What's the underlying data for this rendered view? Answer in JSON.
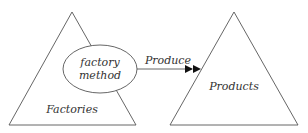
{
  "diagram": {
    "type": "factory-method-pattern",
    "nodes": {
      "factories": {
        "label": "Factories",
        "shape": "triangle"
      },
      "factory_method": {
        "label_line1": "factory",
        "label_line2": "method",
        "shape": "ellipse"
      },
      "products": {
        "label": "Products",
        "shape": "triangle"
      }
    },
    "edges": [
      {
        "from": "factory_method",
        "to": "products",
        "label": "Produce",
        "arrowhead": "double-filled"
      }
    ],
    "colors": {
      "stroke": "#555555",
      "text": "#333333",
      "background": "#ffffff",
      "arrowhead": "#111111"
    }
  }
}
